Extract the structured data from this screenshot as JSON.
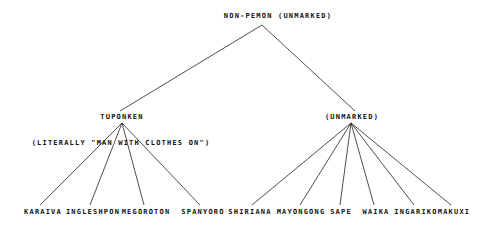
{
  "root": {
    "label": "non-Pemon (unmarked)"
  },
  "branches": [
    {
      "label": "TUPONKEN",
      "gloss": "(LITERALLY \"MAN WITH CLOTHES ON\")",
      "children": [
        "Karaiva",
        "Ingleshpon",
        "Megoroton",
        "Spanyoro"
      ]
    },
    {
      "label": "(UNMARKED)",
      "children": [
        "Shiriana",
        "Mayongong",
        "Sape",
        "Waika",
        "Ingariko",
        "Makuxi"
      ]
    }
  ]
}
